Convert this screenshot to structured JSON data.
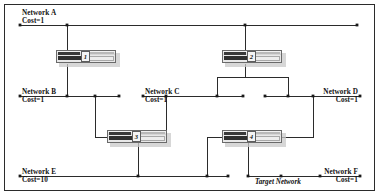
{
  "diagram": {
    "type": "network-topology",
    "title_visible": false,
    "background_color": "#ffffff",
    "line_color": "#2b2b2b",
    "frame_color": "#2b2b2b",
    "node_dot_color": "#1a1a1a",
    "networks": [
      {
        "id": "network-a",
        "name": "Network A",
        "cost": "Cost=1",
        "bus": {
          "x1": 20,
          "x2": 357,
          "y": 25
        },
        "label": {
          "x": 22,
          "y": 9,
          "align": "left"
        },
        "taps": [
          20,
          67,
          245,
          357
        ]
      },
      {
        "id": "network-b",
        "name": "Network B",
        "cost": "Cost=1",
        "bus": {
          "x1": 20,
          "x2": 119,
          "y": 96
        },
        "label": {
          "x": 22,
          "y": 88,
          "align": "left"
        },
        "taps": [
          20,
          67,
          95,
          119
        ]
      },
      {
        "id": "network-c",
        "name": "Network C",
        "cost": "Cost=1",
        "bus": {
          "x1": 143,
          "x2": 243,
          "y": 96
        },
        "label": {
          "x": 145,
          "y": 88,
          "align": "left"
        },
        "taps": [
          143,
          166,
          217,
          243
        ]
      },
      {
        "id": "network-d",
        "name": "Network D",
        "cost": "Cost=1",
        "bus": {
          "x1": 265,
          "x2": 360,
          "y": 96
        },
        "label": {
          "x": 358,
          "y": 88,
          "align": "right"
        },
        "taps": [
          265,
          288,
          313,
          360
        ]
      },
      {
        "id": "network-e",
        "name": "Network E",
        "cost": "Cost=10",
        "bus": {
          "x1": 20,
          "x2": 228,
          "y": 176
        },
        "label": {
          "x": 22,
          "y": 168,
          "align": "left"
        },
        "taps": [
          20,
          138,
          207,
          228
        ]
      },
      {
        "id": "network-f",
        "name": "Network F",
        "cost": "Cost=1",
        "bus": {
          "x1": 248,
          "x2": 360,
          "y": 176
        },
        "label": {
          "x": 358,
          "y": 168,
          "align": "right"
        },
        "taps": [
          248,
          281,
          320,
          360
        ]
      }
    ],
    "target_network": {
      "label": "Target Network",
      "annotates": "network-f",
      "x": 255,
      "y": 178
    },
    "routers": [
      {
        "id": "router-1",
        "number": "1",
        "x": 56,
        "y": 50
      },
      {
        "id": "router-2",
        "number": "2",
        "x": 222,
        "y": 50
      },
      {
        "id": "router-3",
        "number": "3",
        "x": 107,
        "y": 130
      },
      {
        "id": "router-4",
        "number": "4",
        "x": 222,
        "y": 130
      }
    ],
    "links": [
      {
        "from": "network-a",
        "to": "router-1",
        "path": "M67,25 L67,57"
      },
      {
        "from": "router-1",
        "to": "network-b",
        "path": "M67,64 L67,96"
      },
      {
        "from": "network-a",
        "to": "router-2",
        "path": "M245,25 L245,57"
      },
      {
        "from": "router-2",
        "to": "network-c",
        "path": "M245,64 L245,77 L217,77 L217,96"
      },
      {
        "from": "router-2",
        "to": "network-d",
        "path": "M245,64 L245,77 L288,77 L288,96"
      },
      {
        "from": "network-b",
        "to": "router-3",
        "path": "M95,96 L95,137 L107,137"
      },
      {
        "from": "network-c",
        "to": "router-3",
        "path": "M166,96 L166,137 L156,137"
      },
      {
        "from": "router-3",
        "to": "network-e",
        "path": "M138,143 L138,176"
      },
      {
        "from": "network-d",
        "to": "router-4",
        "path": "M313,96 L313,137 L271,137"
      },
      {
        "from": "network-e",
        "to": "router-4",
        "path": "M207,176 L207,137 L222,137"
      },
      {
        "from": "router-4",
        "to": "network-f",
        "path": "M248,143 L248,176"
      }
    ]
  }
}
